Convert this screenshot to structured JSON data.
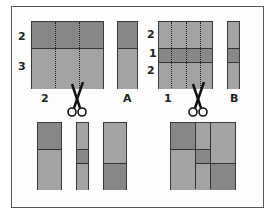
{
  "figure": {
    "left_panel": {
      "rows_labels": [
        "2",
        "3"
      ],
      "bottom_label": "2",
      "strip_label": "A"
    },
    "right_panel": {
      "rows_labels": [
        "2",
        "1",
        "2"
      ],
      "bottom_label": "1",
      "strip_label": "B"
    },
    "colors": {
      "light_fabric": "#a3a3a3",
      "dark_fabric": "#878787",
      "outline": "#333333"
    }
  }
}
